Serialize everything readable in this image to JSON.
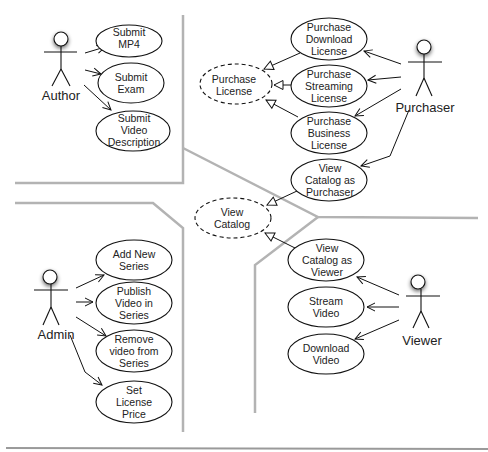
{
  "diagram": {
    "type": "uml-use-case",
    "colors": {
      "line": "#111111",
      "frame": "#b3b3b3",
      "background": "#ffffff"
    },
    "actors": [
      {
        "id": "author",
        "label": "Author"
      },
      {
        "id": "purchaser",
        "label": "Purchaser"
      },
      {
        "id": "admin",
        "label": "Admin"
      },
      {
        "id": "viewer",
        "label": "Viewer"
      }
    ],
    "use_cases": {
      "submit_mp4": [
        "Submit",
        "MP4"
      ],
      "submit_exam": [
        "Submit",
        "Exam"
      ],
      "submit_video_description": [
        "Submit",
        "Video",
        "Description"
      ],
      "purchase_license": [
        "Purchase",
        "License"
      ],
      "purchase_download_license": [
        "Purchase",
        "Download",
        "License"
      ],
      "purchase_streaming_license": [
        "Purchase",
        "Streaming",
        "License"
      ],
      "purchase_business_license": [
        "Purchase",
        "Business",
        "License"
      ],
      "view_catalog_as_purchaser": [
        "View",
        "Catalog as",
        "Purchaser"
      ],
      "view_catalog": [
        "View",
        "Catalog"
      ],
      "add_new_series": [
        "Add New",
        "Series"
      ],
      "publish_video_in_series": [
        "Publish",
        "Video in",
        "Series"
      ],
      "remove_video_from_series": [
        "Remove",
        "video from",
        "Series"
      ],
      "set_license_price": [
        "Set",
        "License",
        "Price"
      ],
      "view_catalog_as_viewer": [
        "View",
        "Catalog as",
        "Viewer"
      ],
      "stream_video": [
        "Stream",
        "Video"
      ],
      "download_video": [
        "Download",
        "Video"
      ]
    },
    "abstract_use_cases": [
      "purchase_license",
      "view_catalog"
    ],
    "associations": [
      {
        "from": "author",
        "to": "submit_mp4"
      },
      {
        "from": "author",
        "to": "submit_exam"
      },
      {
        "from": "author",
        "to": "submit_video_description"
      },
      {
        "from": "purchaser",
        "to": "purchase_download_license"
      },
      {
        "from": "purchaser",
        "to": "purchase_streaming_license"
      },
      {
        "from": "purchaser",
        "to": "purchase_business_license"
      },
      {
        "from": "purchaser",
        "to": "view_catalog_as_purchaser"
      },
      {
        "from": "admin",
        "to": "add_new_series"
      },
      {
        "from": "admin",
        "to": "publish_video_in_series"
      },
      {
        "from": "admin",
        "to": "remove_video_from_series"
      },
      {
        "from": "admin",
        "to": "set_license_price"
      },
      {
        "from": "viewer",
        "to": "view_catalog_as_viewer"
      },
      {
        "from": "viewer",
        "to": "stream_video"
      },
      {
        "from": "viewer",
        "to": "download_video"
      }
    ],
    "generalizations": [
      {
        "child": "purchase_download_license",
        "parent": "purchase_license"
      },
      {
        "child": "purchase_streaming_license",
        "parent": "purchase_license"
      },
      {
        "child": "purchase_business_license",
        "parent": "purchase_license"
      },
      {
        "child": "view_catalog_as_purchaser",
        "parent": "view_catalog"
      },
      {
        "child": "view_catalog_as_viewer",
        "parent": "view_catalog"
      }
    ]
  }
}
